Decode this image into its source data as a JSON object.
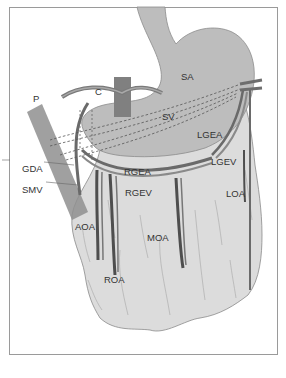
{
  "figure": {
    "type": "anatomical-diagram",
    "colors": {
      "stomach": "#bdbdbd",
      "omentum": "#dcdcdc",
      "vessel": "#7a7a7a",
      "vessel_dark": "#555555",
      "pancreas_bar": "#8f8f8f",
      "crus_bar": "#808080",
      "frame": "#9a9a9a",
      "text": "#333333"
    }
  },
  "labels": {
    "P": "P",
    "C": "C",
    "SA": "SA",
    "SV": "SV",
    "LGEA": "LGEA",
    "LGEV": "LGEV",
    "GDA": "GDA",
    "SMV": "SMV",
    "RGEA": "RGEA",
    "RGEV": "RGEV",
    "AOA": "AOA",
    "ROA": "ROA",
    "MOA": "MOA",
    "LOA": "LOA"
  }
}
